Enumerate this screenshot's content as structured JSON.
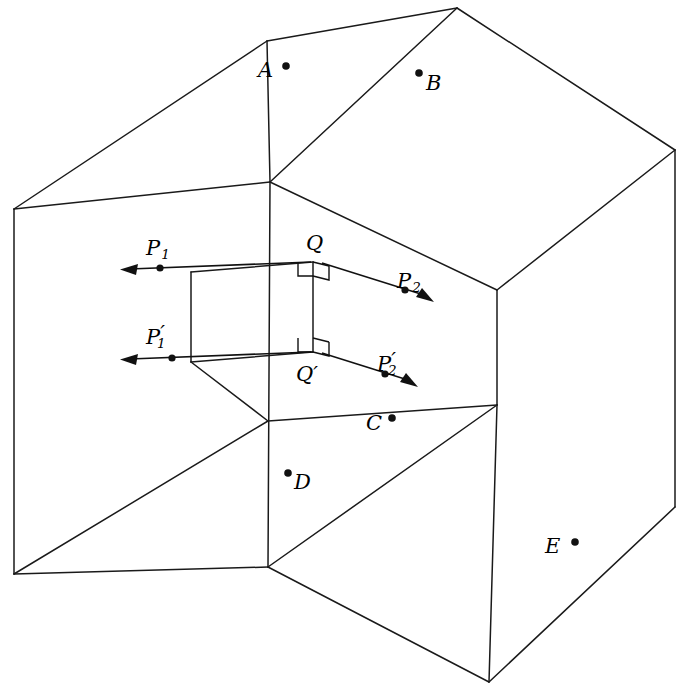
{
  "figure": {
    "type": "geometry-diagram",
    "background_color": "#ffffff",
    "line_color": "#1a1a1a",
    "width": 689,
    "height": 690
  },
  "point_labels": [
    {
      "id": "A",
      "text": "A",
      "dot_side": "right",
      "x": 266,
      "y": 73,
      "dot_x": 286,
      "dot_y": 66
    },
    {
      "id": "B",
      "text": "B",
      "dot_side": "left",
      "x": 429,
      "y": 88,
      "dot_x": 419,
      "dot_y": 73
    },
    {
      "id": "C",
      "text": "C",
      "dot_side": "right",
      "x": 371,
      "y": 430,
      "dot_x": 392,
      "dot_y": 418
    },
    {
      "id": "D",
      "text": "D",
      "dot_side": "left",
      "x": 295,
      "y": 489,
      "dot_x": 288,
      "dot_y": 473
    },
    {
      "id": "E",
      "text": "E",
      "dot_side": "right",
      "x": 548,
      "y": 552,
      "dot_x": 575,
      "dot_y": 542
    }
  ],
  "vertex_labels": [
    {
      "id": "Q",
      "text": "Q",
      "prime": "",
      "x": 311,
      "y": 249
    },
    {
      "id": "Q-prime",
      "text": "Q",
      "prime": "′",
      "x": 300,
      "y": 380
    }
  ],
  "ray_labels": [
    {
      "id": "P1",
      "base": "P",
      "sub": "1",
      "prime": "",
      "x": 150,
      "y": 255
    },
    {
      "id": "P2",
      "base": "P",
      "sub": "2",
      "prime": "",
      "x": 401,
      "y": 288
    },
    {
      "id": "P1-prime",
      "base": "P",
      "sub": "1",
      "prime": "′",
      "x": 150,
      "y": 344
    },
    {
      "id": "P2-prime",
      "base": "P",
      "sub": "2",
      "prime": "′",
      "x": 381,
      "y": 371
    }
  ],
  "rays": [
    {
      "id": "ray-P1",
      "from_label": "Q",
      "to_label": "P1",
      "direction": "left",
      "start": [
        311,
        262
      ],
      "end": [
        122,
        269
      ],
      "dot": [
        160,
        268
      ]
    },
    {
      "id": "ray-P2",
      "from_label": "Q",
      "to_label": "P2",
      "direction": "down-right",
      "start": [
        322,
        263
      ],
      "end": [
        432,
        298
      ],
      "dot": [
        405,
        290
      ]
    },
    {
      "id": "ray-P1-prime",
      "from_label": "Q-prime",
      "to_label": "P1-prime",
      "direction": "left",
      "start": [
        311,
        352
      ],
      "end": [
        122,
        359
      ],
      "dot": [
        172,
        358
      ]
    },
    {
      "id": "ray-P2-prime",
      "from_label": "Q-prime",
      "to_label": "P2-prime",
      "direction": "down-right",
      "start": [
        322,
        353
      ],
      "end": [
        416,
        383
      ],
      "dot": [
        385,
        374
      ]
    }
  ],
  "right_angles": [
    {
      "id": "right-angle-Q",
      "at": [
        313,
        258
      ]
    },
    {
      "id": "right-angle-Q-prime",
      "at": [
        313,
        345
      ]
    }
  ],
  "segments": {
    "QQ-prime": {
      "from": [
        313,
        262
      ],
      "to": [
        313,
        345
      ]
    }
  }
}
